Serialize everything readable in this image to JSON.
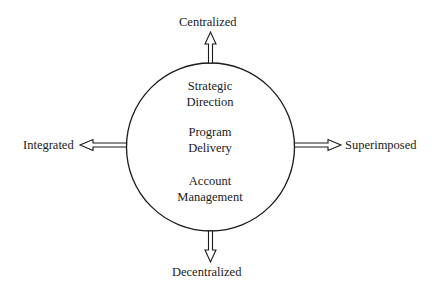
{
  "diagram": {
    "axis_labels": {
      "top": "Centralized",
      "bottom": "Decentralized",
      "left": "Integrated",
      "right": "Superimposed"
    },
    "circle_items": [
      {
        "line1": "Strategic",
        "line2": "Direction"
      },
      {
        "line1": "Program",
        "line2": "Delivery"
      },
      {
        "line1": "Account",
        "line2": "Management"
      }
    ],
    "arrows": [
      "up",
      "down",
      "left",
      "right"
    ],
    "colors": {
      "stroke": "#1a1a1a",
      "background": "#ffffff"
    }
  }
}
